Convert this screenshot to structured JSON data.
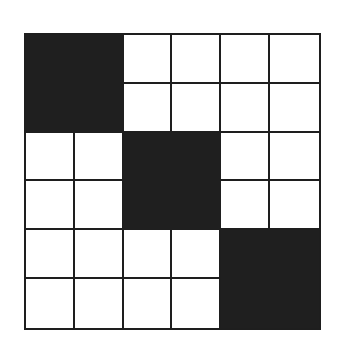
{
  "diagram": {
    "type": "grid",
    "rows": 6,
    "cols": 6,
    "colors": {
      "line": "#1e1e1e",
      "filled": "#1f1f1f",
      "empty": "#ffffff"
    },
    "filled_blocks": [
      {
        "row": 0,
        "col": 0,
        "rowspan": 2,
        "colspan": 2
      },
      {
        "row": 2,
        "col": 2,
        "rowspan": 2,
        "colspan": 2
      },
      {
        "row": 4,
        "col": 4,
        "rowspan": 2,
        "colspan": 2
      }
    ]
  }
}
